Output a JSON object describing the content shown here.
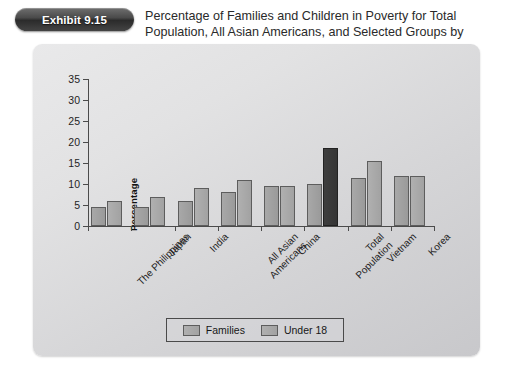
{
  "badge": {
    "label": "Exhibit 9.15"
  },
  "caption": {
    "text": "Percentage of Families and Children in Poverty for Total Population, All Asian Americans, and Selected Groups by Nation of Origin, 2006"
  },
  "legend": {
    "items": [
      {
        "label": "Families",
        "color": "#a8a8a8"
      },
      {
        "label": "Under 18",
        "color": "#b0b0b0"
      }
    ]
  },
  "colors": {
    "bar_families": "#a8a8a8",
    "bar_under18": "#b0b0b0",
    "bar_highlight": "#3b3b3b",
    "panel": "#d8d8da",
    "axis": "#4b4b4b"
  },
  "chart_data": {
    "type": "bar",
    "title": "Percentage of Families and Children in Poverty for Total Population, All Asian Americans, and Selected Groups by Nation of Origin, 2006",
    "xlabel": "",
    "ylabel": "Percentage",
    "ylim": [
      0,
      35
    ],
    "yticks": [
      0,
      5,
      10,
      15,
      20,
      25,
      30,
      35
    ],
    "ytick_labels": [
      "0",
      "5",
      "10",
      "15",
      "20",
      "25",
      "30",
      "35"
    ],
    "grid": false,
    "legend_position": "bottom",
    "categories": [
      "The Philippines",
      "Japan",
      "India",
      "All Asian Americans",
      "China",
      "Total Population",
      "Vietnam",
      "Korea"
    ],
    "category_lines": [
      [
        "The Philippines"
      ],
      [
        "Japan"
      ],
      [
        "India"
      ],
      [
        "All Asian",
        "Americans"
      ],
      [
        "China"
      ],
      [
        "Total",
        "Population"
      ],
      [
        "Vietnam"
      ],
      [
        "Korea"
      ]
    ],
    "series": [
      {
        "name": "Families",
        "values": [
          4.5,
          4.5,
          6.0,
          8.0,
          9.5,
          10.0,
          11.5,
          12.0
        ]
      },
      {
        "name": "Under 18",
        "values": [
          6.0,
          7.0,
          9.0,
          11.0,
          9.5,
          18.5,
          15.5,
          12.0
        ]
      }
    ],
    "highlighted_bar": {
      "category": "Total Population",
      "series": "Under 18"
    }
  }
}
